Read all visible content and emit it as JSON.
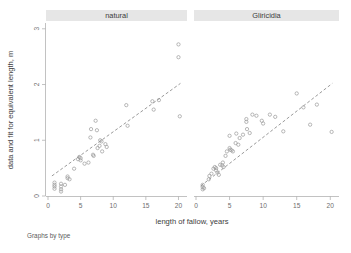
{
  "chart_data": {
    "type": "scatter",
    "title": "",
    "subtitle": "",
    "caption": "Graphs by type",
    "xlabel": "length of fallow, years",
    "ylabel": "data and fit for equivalent length, m",
    "xlim": [
      0,
      21
    ],
    "ylim": [
      0,
      3.05
    ],
    "xticks": [
      0,
      5,
      10,
      15,
      20
    ],
    "xticklabels": [
      "0",
      "5",
      "10",
      "15",
      "20"
    ],
    "yticks": [
      0,
      1,
      2,
      3
    ],
    "yticklabels": [
      "0",
      "1",
      "2",
      "3"
    ],
    "grid": false,
    "legend": "none",
    "marker": "open-circle",
    "facet_by": "type",
    "panels": [
      {
        "label": "natural",
        "points": [
          {
            "x": 1.0,
            "y": 0.2
          },
          {
            "x": 1.0,
            "y": 0.17
          },
          {
            "x": 1.0,
            "y": 0.13
          },
          {
            "x": 1.0,
            "y": 0.24
          },
          {
            "x": 2.0,
            "y": 0.22
          },
          {
            "x": 2.0,
            "y": 0.17
          },
          {
            "x": 2.0,
            "y": 0.12
          },
          {
            "x": 2.0,
            "y": 0.08
          },
          {
            "x": 2.6,
            "y": 0.2
          },
          {
            "x": 3.0,
            "y": 0.35
          },
          {
            "x": 3.0,
            "y": 0.32
          },
          {
            "x": 3.3,
            "y": 0.3
          },
          {
            "x": 4.0,
            "y": 0.49
          },
          {
            "x": 4.6,
            "y": 0.66
          },
          {
            "x": 4.8,
            "y": 0.7
          },
          {
            "x": 5.0,
            "y": 0.68
          },
          {
            "x": 5.0,
            "y": 0.64
          },
          {
            "x": 5.6,
            "y": 0.58
          },
          {
            "x": 6.2,
            "y": 0.6
          },
          {
            "x": 6.5,
            "y": 1.05
          },
          {
            "x": 6.6,
            "y": 1.2
          },
          {
            "x": 6.9,
            "y": 0.74
          },
          {
            "x": 7.0,
            "y": 0.72
          },
          {
            "x": 7.3,
            "y": 1.35
          },
          {
            "x": 7.5,
            "y": 1.18
          },
          {
            "x": 7.6,
            "y": 0.86
          },
          {
            "x": 7.9,
            "y": 0.9
          },
          {
            "x": 8.0,
            "y": 1.0
          },
          {
            "x": 8.2,
            "y": 0.98
          },
          {
            "x": 8.3,
            "y": 0.8
          },
          {
            "x": 8.8,
            "y": 0.93
          },
          {
            "x": 9.0,
            "y": 0.88
          },
          {
            "x": 12.0,
            "y": 1.63
          },
          {
            "x": 12.2,
            "y": 1.26
          },
          {
            "x": 16.0,
            "y": 1.7
          },
          {
            "x": 16.2,
            "y": 1.55
          },
          {
            "x": 17.0,
            "y": 1.72
          },
          {
            "x": 20.0,
            "y": 2.72
          },
          {
            "x": 20.0,
            "y": 2.49
          },
          {
            "x": 20.2,
            "y": 1.43
          }
        ],
        "fit": {
          "x0": 0.6,
          "y0": 0.36,
          "x1": 20.3,
          "y1": 2.02
        }
      },
      {
        "label": "Gliricidia",
        "points": [
          {
            "x": 1.0,
            "y": 0.16
          },
          {
            "x": 1.0,
            "y": 0.12
          },
          {
            "x": 1.0,
            "y": 0.2
          },
          {
            "x": 1.2,
            "y": 0.14
          },
          {
            "x": 1.9,
            "y": 0.3
          },
          {
            "x": 2.0,
            "y": 0.36
          },
          {
            "x": 2.3,
            "y": 0.4
          },
          {
            "x": 2.6,
            "y": 0.49
          },
          {
            "x": 2.8,
            "y": 0.52
          },
          {
            "x": 3.0,
            "y": 0.5
          },
          {
            "x": 3.0,
            "y": 0.46
          },
          {
            "x": 3.2,
            "y": 0.42
          },
          {
            "x": 3.4,
            "y": 0.38
          },
          {
            "x": 3.6,
            "y": 0.56
          },
          {
            "x": 3.9,
            "y": 0.55
          },
          {
            "x": 4.0,
            "y": 0.6
          },
          {
            "x": 4.1,
            "y": 0.52
          },
          {
            "x": 4.4,
            "y": 0.72
          },
          {
            "x": 4.6,
            "y": 0.8
          },
          {
            "x": 5.0,
            "y": 0.86
          },
          {
            "x": 5.1,
            "y": 0.83
          },
          {
            "x": 5.3,
            "y": 0.82
          },
          {
            "x": 5.5,
            "y": 0.8
          },
          {
            "x": 5.0,
            "y": 1.08
          },
          {
            "x": 5.9,
            "y": 0.95
          },
          {
            "x": 6.0,
            "y": 1.12
          },
          {
            "x": 6.3,
            "y": 0.92
          },
          {
            "x": 6.5,
            "y": 1.04
          },
          {
            "x": 7.0,
            "y": 1.1
          },
          {
            "x": 7.5,
            "y": 1.38
          },
          {
            "x": 7.5,
            "y": 1.33
          },
          {
            "x": 7.6,
            "y": 1.2
          },
          {
            "x": 8.0,
            "y": 1.13
          },
          {
            "x": 8.4,
            "y": 1.46
          },
          {
            "x": 9.0,
            "y": 1.44
          },
          {
            "x": 9.8,
            "y": 1.35
          },
          {
            "x": 10.0,
            "y": 1.3
          },
          {
            "x": 11.0,
            "y": 1.46
          },
          {
            "x": 11.8,
            "y": 1.42
          },
          {
            "x": 13.0,
            "y": 1.16
          },
          {
            "x": 15.0,
            "y": 1.84
          },
          {
            "x": 16.0,
            "y": 1.59
          },
          {
            "x": 17.0,
            "y": 1.28
          },
          {
            "x": 18.0,
            "y": 1.64
          },
          {
            "x": 20.2,
            "y": 1.15
          }
        ],
        "fit": {
          "x0": 0.7,
          "y0": 0.18,
          "x1": 20.3,
          "y1": 2.02
        }
      }
    ]
  },
  "chart": {
    "ylabel": "data and fit for equivalent length, m",
    "xlabel": "length of fallow, years",
    "caption": "Graphs by type",
    "panel_natural_label": "natural",
    "panel_gliricidia_label": "Gliricidia"
  }
}
